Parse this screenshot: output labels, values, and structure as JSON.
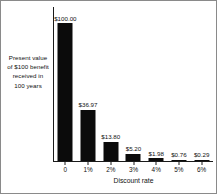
{
  "chart_data": {
    "type": "bar",
    "title": "",
    "xlabel": "Discount rate",
    "ylabel": "Present value of $100 benefit received in 100 years",
    "categories": [
      "0",
      "1%",
      "2%",
      "3%",
      "4%",
      "5%",
      "6%"
    ],
    "values": [
      100.0,
      36.97,
      13.8,
      5.2,
      1.98,
      0.76,
      0.29
    ],
    "point_labels": [
      "$100.00",
      "$36.97",
      "$13.80",
      "$5.20",
      "$1.98",
      "$0.76",
      "$0.29"
    ],
    "ylim": [
      0,
      100
    ],
    "grid": false,
    "legend": null,
    "series": [
      {
        "name": "Present value",
        "values": [
          100.0,
          36.97,
          13.8,
          5.2,
          1.98,
          0.76,
          0.29
        ]
      }
    ]
  },
  "axis": {
    "y_caption_lines": [
      "Present value",
      "of $100 benefit",
      "received in",
      "100 years"
    ],
    "x_title": "Discount rate"
  },
  "colors": {
    "bar": "#0b0b0b",
    "axis": "#1a1a1a",
    "text": "#111111",
    "background": "#ffffff",
    "border": "#8a8a8a"
  }
}
